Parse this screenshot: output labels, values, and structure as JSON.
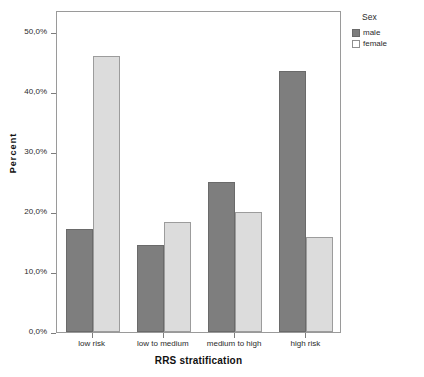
{
  "chart_data": {
    "type": "bar",
    "title": "",
    "xlabel": "RRS stratification",
    "ylabel": "Percent",
    "categories": [
      "low risk",
      "low to medium",
      "medium to high",
      "high risk"
    ],
    "series": [
      {
        "name": "male",
        "color": "#7e7e7e",
        "values": [
          17.2,
          14.5,
          25.0,
          43.5
        ]
      },
      {
        "name": "female",
        "color": "#dcdcdc",
        "values": [
          46.0,
          18.3,
          20.0,
          15.8
        ]
      }
    ],
    "ylim": [
      0,
      52
    ],
    "ytick_values": [
      0,
      10,
      20,
      30,
      40,
      50
    ],
    "ytick_labels": [
      "0,0%",
      "10,0%",
      "20,0%",
      "30,0%",
      "40,0%",
      "50,0%"
    ],
    "grid": false,
    "legend": {
      "title": "Sex",
      "position": "right-top",
      "entries": [
        {
          "label": "male",
          "swatch": "dark-gray-filled"
        },
        {
          "label": "female",
          "swatch": "light-gray-outlined"
        }
      ]
    }
  }
}
